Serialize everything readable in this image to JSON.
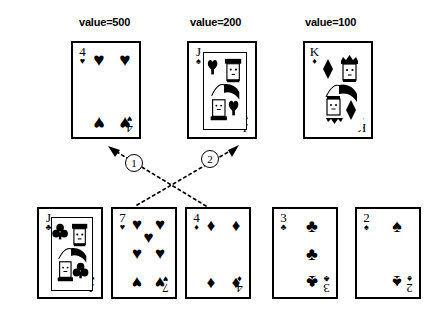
{
  "top_row": {
    "cards": [
      {
        "id": "card-4-hearts",
        "rank": "4",
        "suit_name": "hearts",
        "suit_glyph": "♥",
        "value_label": "value=500",
        "type": "pip"
      },
      {
        "id": "card-jack-spades",
        "rank": "J",
        "suit_name": "spades",
        "suit_glyph": "♠",
        "value_label": "value=200",
        "type": "face"
      },
      {
        "id": "card-king-diamonds",
        "rank": "K",
        "suit_name": "diamonds",
        "suit_glyph": "♦",
        "value_label": "value=100",
        "type": "face"
      }
    ]
  },
  "bottom_row": {
    "cards": [
      {
        "id": "card-jack-clubs",
        "rank": "J",
        "suit_name": "clubs",
        "suit_glyph": "♣",
        "type": "face"
      },
      {
        "id": "card-7-hearts",
        "rank": "7",
        "suit_name": "hearts",
        "suit_glyph": "♥",
        "type": "pip"
      },
      {
        "id": "card-4-diamonds",
        "rank": "4",
        "suit_name": "diamonds",
        "suit_glyph": "♦",
        "type": "pip"
      },
      {
        "id": "card-3-clubs",
        "rank": "3",
        "suit_name": "clubs",
        "suit_glyph": "♣",
        "type": "pip"
      },
      {
        "id": "card-2-spades",
        "rank": "2",
        "suit_name": "spades",
        "suit_glyph": "♠",
        "type": "pip"
      }
    ]
  },
  "annotations": {
    "markers": [
      {
        "id": "marker-1",
        "label": "1"
      },
      {
        "id": "marker-2",
        "label": "2"
      }
    ]
  },
  "colors": {
    "ink": "#000000",
    "paper": "#ffffff"
  }
}
